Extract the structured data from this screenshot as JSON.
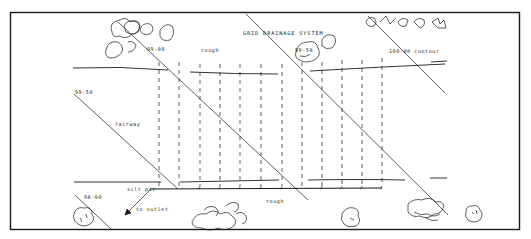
{
  "diagram": {
    "title": "GRID DRAINAGE SYSTEM",
    "frame": {
      "x": 10,
      "y": 12,
      "width": 510,
      "height": 218,
      "stroke": "#1a1a1a"
    },
    "labels": [
      {
        "id": "title",
        "text": "GRID DRAINAGE SYSTEM",
        "x": 243,
        "y": 35
      },
      {
        "id": "contour-99-00",
        "text": "99-00",
        "x": 147,
        "y": 51
      },
      {
        "id": "rough-top",
        "text": "rough",
        "x": 201,
        "y": 52
      },
      {
        "id": "contour-99-50-right",
        "text": "99-50",
        "x": 295,
        "y": 52
      },
      {
        "id": "contour-100-00",
        "text": "100-00 contour",
        "x": 389,
        "y": 53
      },
      {
        "id": "contour-99-50-left",
        "text": "99-50",
        "x": 75,
        "y": 94
      },
      {
        "id": "fairway",
        "text": "fairway",
        "x": 115,
        "y": 126
      },
      {
        "id": "silt-pit",
        "text": "silt pit",
        "x": 127,
        "y": 191
      },
      {
        "id": "contour-98-00",
        "text": "98-00",
        "x": 84,
        "y": 199
      },
      {
        "id": "to-outlet",
        "text": "to outlet",
        "x": 136,
        "y": 211
      },
      {
        "id": "rough-bottom",
        "text": "rough",
        "x": 266,
        "y": 203
      }
    ],
    "contour_lines": [
      {
        "x1": 92,
        "y1": 178,
        "x2": 170,
        "y2": 247
      },
      {
        "x1": 148,
        "y1": 48,
        "x2": 308,
        "y2": 198
      },
      {
        "x1": 240,
        "y1": 12,
        "x2": 500,
        "y2": 230
      },
      {
        "x1": 368,
        "y1": 12,
        "x2": 490,
        "y2": 95
      },
      {
        "x1": 74,
        "y1": 92,
        "x2": 110,
        "y2": 122
      },
      {
        "x1": 80,
        "y1": 196,
        "x2": 110,
        "y2": 228
      }
    ],
    "laterals_x": [
      159,
      179,
      200,
      220,
      240,
      261,
      282,
      302,
      322,
      342,
      362,
      382
    ],
    "laterals_top": 62,
    "laterals_bottom": 184,
    "main_drain": {
      "x1": 150,
      "y1": 188,
      "x2": 382,
      "y2": 187
    },
    "edge_lines": [
      {
        "x1": 73,
        "y1": 68,
        "x2": 168,
        "y2": 70
      },
      {
        "x1": 190,
        "y1": 72,
        "x2": 276,
        "y2": 74
      },
      {
        "x1": 310,
        "y1": 71,
        "x2": 445,
        "y2": 64
      },
      {
        "x1": 431,
        "y1": 62,
        "x2": 447,
        "y2": 62
      },
      {
        "x1": 74,
        "y1": 182,
        "x2": 160,
        "y2": 182
      },
      {
        "x1": 180,
        "y1": 182,
        "x2": 279,
        "y2": 180
      },
      {
        "x1": 308,
        "y1": 180,
        "x2": 405,
        "y2": 180
      },
      {
        "x1": 430,
        "y1": 178,
        "x2": 447,
        "y2": 178
      }
    ],
    "outlet_arrow": {
      "x1": 150,
      "y1": 189,
      "x2": 126,
      "y2": 213
    },
    "tree_clusters": [
      {
        "id": "trees-top-left",
        "cx": 140,
        "cy": 33
      },
      {
        "id": "trees-top-center",
        "cx": 326,
        "cy": 47
      },
      {
        "id": "trees-top-right",
        "cx": 410,
        "cy": 25
      },
      {
        "id": "tree-bottom-left",
        "cx": 83,
        "cy": 218
      },
      {
        "id": "trees-bottom-center",
        "cx": 225,
        "cy": 217
      },
      {
        "id": "tree-bottom-mid",
        "cx": 353,
        "cy": 216
      },
      {
        "id": "trees-bottom-right",
        "cx": 438,
        "cy": 205
      },
      {
        "id": "tree-bottom-far-right",
        "cx": 474,
        "cy": 213
      }
    ],
    "colors": {
      "ink": "#1a1a1a",
      "paper": "#ffffff"
    }
  }
}
